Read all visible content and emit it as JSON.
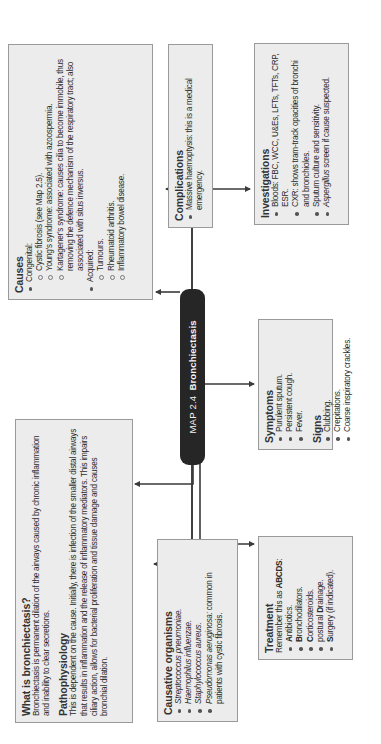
{
  "title": {
    "prefix": "MAP 2.4",
    "name": "Bronchiectasis"
  },
  "colors": {
    "box_fill": "#ececec",
    "box_border": "#9a9a9a",
    "pill_fill": "#262626",
    "connector": "#3a3a3a",
    "text": "#2b2b2b"
  },
  "causes": {
    "heading": "Causes",
    "congenital_label": "Congenital:",
    "congenital": [
      "Cystic fibrosis (see Map 2.5).",
      "Young's syndrome: associated with azoospermia.",
      "Kartagener's syndrome: causes cilia to become immobile, thus removing the defence mechanism of the respiratory tract; also associated with situs inversus."
    ],
    "acquired_label": "Acquired:",
    "acquired": [
      "Tumours.",
      "Rheumatoid arthritis.",
      "Inflammatory bowel disease."
    ]
  },
  "complications": {
    "heading": "Complications",
    "items": [
      "Massive haemoptysis: this is a medical emergency."
    ]
  },
  "investigations": {
    "heading": "Investigations",
    "items": [
      "Bloods: FBC, WCC, U&Es, LFTs, TFTs, CRP, ESR.",
      "CXR: shows tram-track opacities of bronchi and bronchioles.",
      "Sputum culture and sensitivity."
    ],
    "last_item_italic": "Aspergillus",
    "last_item_rest": " screen if cause suspected."
  },
  "what_is": {
    "heading": "What is bronchiectasis?",
    "text": "Bronchiectasis is permanent dilation of the airways caused by chronic inflammation and inability to clear secretions."
  },
  "pathophysiology": {
    "heading": "Pathophysiology",
    "text": "This is dependent on the cause. Initially, there is infection of the smaller distal airways that results in inflammation and the release of inflammatory mediators. This impairs ciliary action, allows for bacterial proliferation and tissue damage and causes bronchial dilation."
  },
  "organisms": {
    "heading": "Causative organisms",
    "items": [
      "Streptococcus pneumoniae.",
      "Haemophilus influenzae.",
      "Staphylococcus aureus."
    ],
    "last_item_italic": "Pseudomonas aeruginosa:",
    "last_item_rest": " common in patients with cystic fibrosis."
  },
  "symptoms": {
    "heading": "Symptoms",
    "items": [
      "Purulent sputum.",
      "Persistent cough.",
      "Fever."
    ]
  },
  "signs": {
    "heading": "Signs",
    "items": [
      "Clubbing.",
      "Crepitations.",
      "Coarse inspiratory crackles."
    ]
  },
  "treatment": {
    "heading": "Treatment",
    "intro": "Remember this as ",
    "mnemonic": "ABCDS",
    "intro_end": ":",
    "items": [
      {
        "pre": "",
        "letter": "A",
        "rest": "ntibiotics."
      },
      {
        "pre": "",
        "letter": "B",
        "rest": "ronchodilators."
      },
      {
        "pre": "",
        "letter": "C",
        "rest": "orticosteroids."
      },
      {
        "pre": "postural ",
        "letter": "D",
        "rest": "rainage."
      },
      {
        "pre": "",
        "letter": "S",
        "rest": "urgery (if indicated)."
      }
    ]
  }
}
